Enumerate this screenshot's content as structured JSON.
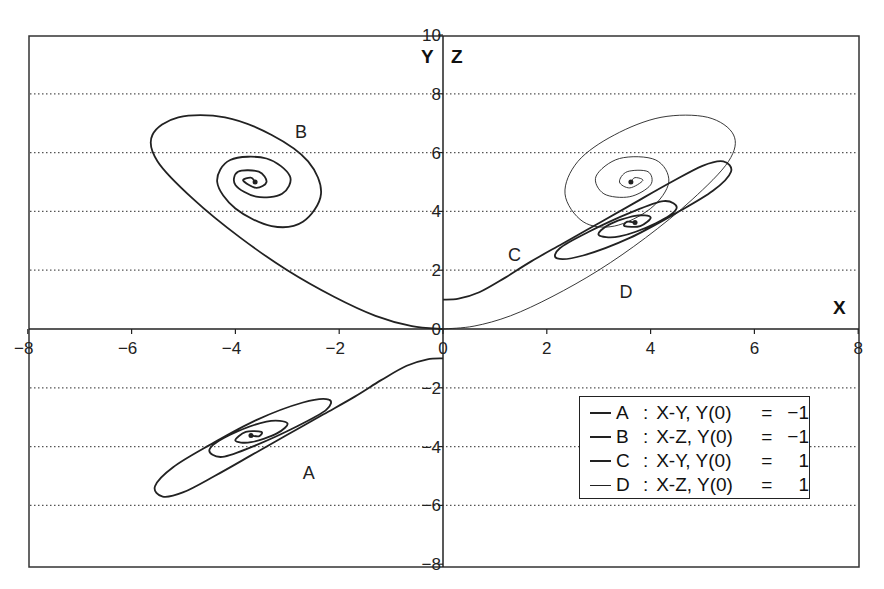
{
  "chart_data": {
    "type": "line",
    "title": "",
    "xlabel": "X",
    "ylabel_left": "Y",
    "ylabel_right": "Z",
    "xlim": [
      -8,
      8
    ],
    "ylim": [
      -8,
      10
    ],
    "x_ticks": [
      -8,
      -6,
      -4,
      -2,
      0,
      2,
      4,
      6,
      8
    ],
    "y_ticks": [
      -8,
      -6,
      -4,
      -2,
      0,
      2,
      4,
      6,
      8,
      10
    ],
    "grid": "horizontal dotted",
    "legend_position": "lower right",
    "series": [
      {
        "name": "A",
        "label": "A : X-Y, Y(0) = −1",
        "stroke_width": 1.8,
        "label_pos": [
          -2.7,
          -5.1
        ],
        "points": [
          [
            0,
            -1
          ],
          [
            -0.3,
            -1.03
          ],
          [
            -0.7,
            -1.25
          ],
          [
            -1.2,
            -1.75
          ],
          [
            -1.7,
            -2.3
          ],
          [
            -2.3,
            -2.9
          ],
          [
            -3.0,
            -3.6
          ],
          [
            -3.7,
            -4.3
          ],
          [
            -4.4,
            -5.0
          ],
          [
            -5.0,
            -5.55
          ],
          [
            -5.4,
            -5.7
          ],
          [
            -5.55,
            -5.35
          ],
          [
            -5.2,
            -4.7
          ],
          [
            -4.5,
            -3.95
          ],
          [
            -3.6,
            -3.1
          ],
          [
            -2.7,
            -2.5
          ],
          [
            -2.2,
            -2.4
          ],
          [
            -2.25,
            -2.75
          ],
          [
            -2.8,
            -3.3
          ],
          [
            -3.6,
            -3.95
          ],
          [
            -4.25,
            -4.35
          ],
          [
            -4.5,
            -4.1
          ],
          [
            -4.1,
            -3.6
          ],
          [
            -3.4,
            -3.15
          ],
          [
            -3.0,
            -3.2
          ],
          [
            -3.2,
            -3.55
          ],
          [
            -3.7,
            -3.85
          ],
          [
            -4.0,
            -3.8
          ],
          [
            -3.8,
            -3.5
          ],
          [
            -3.5,
            -3.5
          ],
          [
            -3.55,
            -3.65
          ],
          [
            -3.7,
            -3.62
          ]
        ]
      },
      {
        "name": "B",
        "label": "B : X-Z, Y(0) = −1",
        "stroke_width": 1.8,
        "label_pos": [
          -2.85,
          6.5
        ],
        "points": [
          [
            0,
            0
          ],
          [
            -0.6,
            0.1
          ],
          [
            -1.3,
            0.45
          ],
          [
            -2.1,
            1.1
          ],
          [
            -3.0,
            2.0
          ],
          [
            -3.9,
            3.1
          ],
          [
            -4.8,
            4.4
          ],
          [
            -5.5,
            5.7
          ],
          [
            -5.6,
            6.6
          ],
          [
            -5.1,
            7.2
          ],
          [
            -4.2,
            7.2
          ],
          [
            -3.3,
            6.6
          ],
          [
            -2.6,
            5.7
          ],
          [
            -2.35,
            4.6
          ],
          [
            -2.7,
            3.65
          ],
          [
            -3.3,
            3.5
          ],
          [
            -4.0,
            4.1
          ],
          [
            -4.35,
            5.0
          ],
          [
            -4.1,
            5.75
          ],
          [
            -3.4,
            5.8
          ],
          [
            -2.95,
            5.2
          ],
          [
            -3.1,
            4.6
          ],
          [
            -3.6,
            4.5
          ],
          [
            -4.0,
            4.9
          ],
          [
            -3.95,
            5.35
          ],
          [
            -3.55,
            5.35
          ],
          [
            -3.4,
            5.0
          ],
          [
            -3.6,
            4.8
          ],
          [
            -3.85,
            5.05
          ],
          [
            -3.7,
            5.15
          ],
          [
            -3.62,
            5.0
          ]
        ]
      },
      {
        "name": "C",
        "label": "C : X-Y, Y(0) =   1",
        "stroke_width": 1.8,
        "label_pos": [
          1.25,
          2.3
        ],
        "points": [
          [
            0,
            1
          ],
          [
            0.3,
            1.03
          ],
          [
            0.7,
            1.25
          ],
          [
            1.2,
            1.75
          ],
          [
            1.7,
            2.3
          ],
          [
            2.3,
            2.9
          ],
          [
            3.0,
            3.6
          ],
          [
            3.7,
            4.3
          ],
          [
            4.4,
            5.0
          ],
          [
            5.0,
            5.55
          ],
          [
            5.4,
            5.7
          ],
          [
            5.55,
            5.35
          ],
          [
            5.2,
            4.7
          ],
          [
            4.5,
            3.95
          ],
          [
            3.6,
            3.1
          ],
          [
            2.7,
            2.5
          ],
          [
            2.2,
            2.4
          ],
          [
            2.25,
            2.75
          ],
          [
            2.8,
            3.3
          ],
          [
            3.6,
            3.95
          ],
          [
            4.25,
            4.35
          ],
          [
            4.5,
            4.1
          ],
          [
            4.1,
            3.6
          ],
          [
            3.4,
            3.15
          ],
          [
            3.0,
            3.2
          ],
          [
            3.2,
            3.55
          ],
          [
            3.7,
            3.85
          ],
          [
            4.0,
            3.8
          ],
          [
            3.8,
            3.5
          ],
          [
            3.5,
            3.5
          ],
          [
            3.55,
            3.65
          ],
          [
            3.7,
            3.62
          ]
        ]
      },
      {
        "name": "D",
        "label": "D : X-Z, Y(0) =   1",
        "stroke_width": 0.9,
        "label_pos": [
          3.4,
          1.05
        ],
        "points": [
          [
            0,
            0
          ],
          [
            0.6,
            0.1
          ],
          [
            1.3,
            0.45
          ],
          [
            2.1,
            1.1
          ],
          [
            3.0,
            2.0
          ],
          [
            3.9,
            3.1
          ],
          [
            4.8,
            4.4
          ],
          [
            5.5,
            5.7
          ],
          [
            5.6,
            6.6
          ],
          [
            5.1,
            7.2
          ],
          [
            4.2,
            7.2
          ],
          [
            3.3,
            6.6
          ],
          [
            2.6,
            5.7
          ],
          [
            2.35,
            4.6
          ],
          [
            2.7,
            3.65
          ],
          [
            3.3,
            3.5
          ],
          [
            4.0,
            4.1
          ],
          [
            4.35,
            5.0
          ],
          [
            4.1,
            5.75
          ],
          [
            3.4,
            5.8
          ],
          [
            2.95,
            5.2
          ],
          [
            3.1,
            4.6
          ],
          [
            3.6,
            4.5
          ],
          [
            4.0,
            4.9
          ],
          [
            3.95,
            5.35
          ],
          [
            3.55,
            5.35
          ],
          [
            3.4,
            5.0
          ],
          [
            3.6,
            4.8
          ],
          [
            3.85,
            5.05
          ],
          [
            3.7,
            5.15
          ],
          [
            3.62,
            5.0
          ]
        ]
      }
    ]
  },
  "axes": {
    "x_title": "X",
    "y_title": "Y",
    "z_title": "Z"
  },
  "legend": {
    "items": [
      {
        "key": "A",
        "desc": "X-Y, Y(0)",
        "eq": "=",
        "val": "−1"
      },
      {
        "key": "B",
        "desc": "X-Z, Y(0)",
        "eq": "=",
        "val": "−1"
      },
      {
        "key": "C",
        "desc": "X-Y, Y(0)",
        "eq": "=",
        "val": "1"
      },
      {
        "key": "D",
        "desc": "X-Z, Y(0)",
        "eq": "=",
        "val": "1"
      }
    ]
  }
}
